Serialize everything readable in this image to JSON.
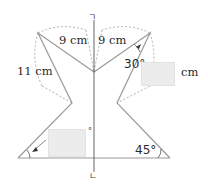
{
  "diagram": {
    "labels": {
      "left_top_length": "9 cm",
      "right_top_length": "9 cm",
      "left_side_length": "11 cm",
      "right_angle_top": "30°",
      "right_angle_bottom": "45°",
      "right_answer_unit": "cm",
      "left_answer_unit": "°"
    },
    "axis_marks": {
      "top": "ㄱ",
      "bottom": "ㄴ"
    },
    "answer_boxes": [
      {
        "id": "left-angle-answer",
        "value": ""
      },
      {
        "id": "right-length-answer",
        "value": ""
      }
    ],
    "colors": {
      "line": "#9a9a9a",
      "dashed": "#a8a8a8",
      "axis": "#555555",
      "answer_box": "#ececec",
      "text": "#2a2a2a"
    }
  }
}
